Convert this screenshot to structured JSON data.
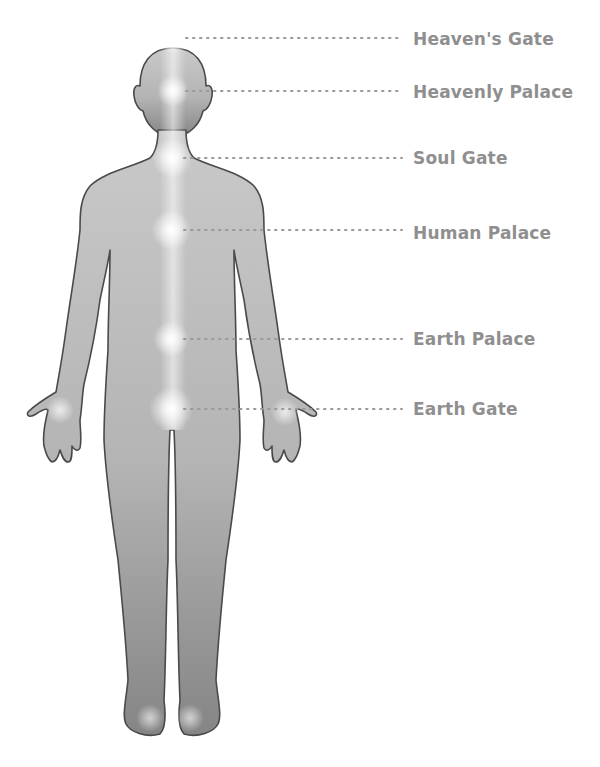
{
  "diagram": {
    "type": "body-energy-points",
    "colors": {
      "body_fill_top": "#c6c6c6",
      "body_fill_bottom": "#8c8c8c",
      "body_outline": "#4a4a4a",
      "label_text": "#8f8f8f",
      "leader_dots": "#9a9a9a",
      "glow": "#ffffff"
    },
    "points": [
      {
        "id": "heavens-gate",
        "label": "Heaven's Gate",
        "x": 173,
        "y": 38,
        "label_y": 40
      },
      {
        "id": "heavenly-palace",
        "label": "Heavenly Palace",
        "x": 173,
        "y": 91,
        "label_y": 93
      },
      {
        "id": "soul-gate",
        "label": "Soul Gate",
        "x": 172,
        "y": 158,
        "label_y": 159
      },
      {
        "id": "human-palace",
        "label": "Human Palace",
        "x": 171,
        "y": 230,
        "label_y": 234
      },
      {
        "id": "earth-palace",
        "label": "Earth Palace",
        "x": 171,
        "y": 339,
        "label_y": 340
      },
      {
        "id": "earth-gate",
        "label": "Earth Gate",
        "x": 171,
        "y": 409,
        "label_y": 410
      }
    ],
    "unlabeled_glows": [
      {
        "id": "left-palm",
        "x": 60,
        "y": 410
      },
      {
        "id": "right-palm",
        "x": 285,
        "y": 412
      },
      {
        "id": "left-foot",
        "x": 150,
        "y": 718
      },
      {
        "id": "right-foot",
        "x": 190,
        "y": 718
      }
    ]
  }
}
